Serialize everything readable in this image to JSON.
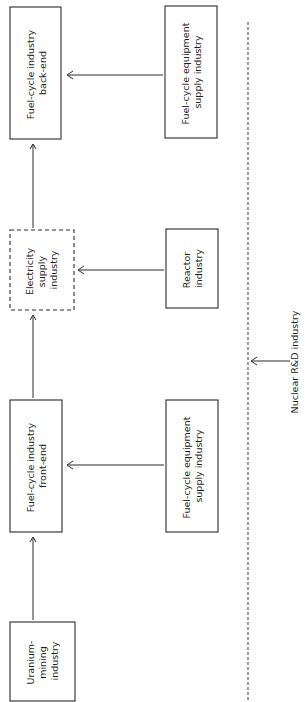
{
  "diagram": {
    "orientation": "rotated-90-ccw",
    "nodes": [
      {
        "id": "uranium",
        "lines": [
          "Uranium-",
          "mining",
          "industry"
        ],
        "style": "solid"
      },
      {
        "id": "frontend",
        "lines": [
          "Fuel-cycle industry",
          "front-end"
        ],
        "style": "solid"
      },
      {
        "id": "electricity",
        "lines": [
          "Electricity",
          "supply",
          "industry"
        ],
        "style": "dashed"
      },
      {
        "id": "backend",
        "lines": [
          "Fuel-cycle industry",
          "back-end"
        ],
        "style": "solid"
      },
      {
        "id": "equip_front",
        "lines": [
          "Fuel-cycle equipment",
          "supply industry"
        ],
        "style": "solid"
      },
      {
        "id": "reactor",
        "lines": [
          "Reactor",
          "industry"
        ],
        "style": "solid"
      },
      {
        "id": "equip_back",
        "lines": [
          "Fuel-cycle equipment",
          "supply industry"
        ],
        "style": "solid"
      }
    ],
    "rd": {
      "label": "Nuclear R&D industry",
      "boundary": "dashed-line"
    },
    "edges": [
      {
        "from": "uranium",
        "to": "frontend"
      },
      {
        "from": "frontend",
        "to": "electricity"
      },
      {
        "from": "electricity",
        "to": "backend"
      },
      {
        "from": "equip_front",
        "to": "frontend"
      },
      {
        "from": "reactor",
        "to": "electricity"
      },
      {
        "from": "equip_back",
        "to": "backend"
      },
      {
        "from": "rd",
        "to": "boundary"
      }
    ]
  }
}
